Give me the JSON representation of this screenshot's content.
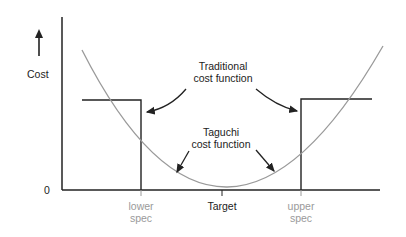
{
  "diagram": {
    "y_axis_label": "Cost",
    "zero_label": "0",
    "x_ticks": [
      {
        "label_lines": [
          "lower",
          "spec"
        ],
        "style": "gray"
      },
      {
        "label_lines": [
          "Target"
        ],
        "style": "black"
      },
      {
        "label_lines": [
          "upper",
          "spec"
        ],
        "style": "gray"
      }
    ],
    "annotations": {
      "traditional": [
        "Traditional",
        "cost function"
      ],
      "taguchi": [
        "Taguchi",
        "cost function"
      ]
    },
    "colors": {
      "axis": "#222222",
      "step_function": "#222222",
      "taguchi_curve": "#9a9a9a",
      "spec_label": "#9a9a9a"
    }
  }
}
